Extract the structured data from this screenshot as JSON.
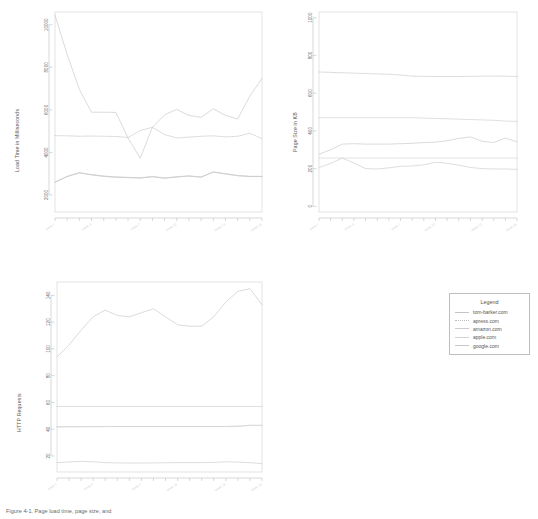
{
  "figure": {
    "caption": "Figure 4-1. Page load time, page size, and",
    "background": "#ffffff"
  },
  "legend": {
    "title": "Legend",
    "entries": [
      {
        "label": "tom-barker.com",
        "style": "solid",
        "color": "#c4c4c4"
      },
      {
        "label": "apress.com",
        "style": "dotted",
        "color": "#bcbcbc"
      },
      {
        "label": "amazon.com",
        "style": "solid",
        "color": "#cccccc"
      },
      {
        "label": "apple.com",
        "style": "solid",
        "color": "#d2d2d2"
      },
      {
        "label": "google.com",
        "style": "solid",
        "color": "#c8c8c8"
      }
    ]
  },
  "chart_data": [
    {
      "type": "line",
      "title": "",
      "xlabel": "",
      "ylabel": "Load Time in Milliseconds",
      "ylim": [
        1200,
        10600
      ],
      "yticks": [
        2000,
        4000,
        6000,
        8000,
        10000
      ],
      "grid": false,
      "legend_position": "external-right",
      "x": [
        1,
        2,
        3,
        4,
        5,
        6,
        7,
        8,
        9,
        10,
        11,
        12,
        13,
        14,
        15,
        16,
        17,
        18
      ],
      "xtick_labels": [
        "week 1",
        "week 4",
        "week 7",
        "week 10",
        "week 13",
        "week 16"
      ],
      "series": [
        {
          "name": "tom-barker.com",
          "style": "solid",
          "values": [
            10450,
            8600,
            6960,
            5890,
            5890,
            5880,
            4680,
            3730,
            5180,
            5770,
            6020,
            5740,
            5650,
            6050,
            5740,
            5570,
            6650,
            7480
          ]
        },
        {
          "name": "apress.com",
          "style": "dotted",
          "values": [
            4790,
            4780,
            4760,
            4770,
            4760,
            4750,
            4700,
            5030,
            5180,
            4840,
            4680,
            4720,
            4760,
            4780,
            4730,
            4760,
            4900,
            4650
          ]
        },
        {
          "name": "amazon.com",
          "style": "solid",
          "values": [
            2610,
            2880,
            3050,
            2960,
            2890,
            2850,
            2830,
            2810,
            2870,
            2800,
            2860,
            2900,
            2850,
            3090,
            3000,
            2920,
            2880,
            2880
          ]
        },
        {
          "name": "apple.com",
          "style": "solid",
          "values": [
            2600,
            2870,
            3040,
            2950,
            2880,
            2840,
            2820,
            2800,
            2860,
            2790,
            2850,
            2890,
            2840,
            3080,
            2990,
            2910,
            2870,
            2870
          ]
        },
        {
          "name": "google.com",
          "style": "solid",
          "values": [
            2595,
            2865,
            3035,
            2945,
            2875,
            2835,
            2815,
            2795,
            2855,
            2785,
            2845,
            2885,
            2835,
            3075,
            2985,
            2905,
            2865,
            2865
          ]
        }
      ]
    },
    {
      "type": "line",
      "title": "",
      "xlabel": "",
      "ylabel": "Page Size in KB",
      "ylim": [
        -30,
        1030
      ],
      "yticks": [
        0,
        200,
        400,
        600,
        800,
        1000
      ],
      "grid": false,
      "legend_position": "external-right",
      "x": [
        1,
        2,
        3,
        4,
        5,
        6,
        7,
        8,
        9,
        10,
        11,
        12,
        13,
        14,
        15,
        16,
        17,
        18
      ],
      "xtick_labels": [
        "week 1",
        "week 4",
        "week 7",
        "week 10",
        "week 13",
        "week 16"
      ],
      "series": [
        {
          "name": "tom-barker.com",
          "style": "solid",
          "values": [
            276,
            300,
            330,
            332,
            330,
            330,
            330,
            332,
            334,
            338,
            340,
            348,
            360,
            368,
            345,
            338,
            362,
            342
          ]
        },
        {
          "name": "apress.com",
          "style": "dotted",
          "values": [
            712,
            710,
            708,
            706,
            704,
            702,
            700,
            696,
            690,
            689,
            688,
            688,
            688,
            689,
            690,
            690,
            690,
            688
          ]
        },
        {
          "name": "amazon.com",
          "style": "solid",
          "values": [
            470,
            470,
            470,
            470,
            470,
            470,
            470,
            470,
            470,
            468,
            466,
            464,
            462,
            460,
            458,
            456,
            452,
            450
          ]
        },
        {
          "name": "apple.com",
          "style": "solid",
          "values": [
            256,
            256,
            256,
            256,
            256,
            256,
            256,
            256,
            256,
            256,
            256,
            256,
            256,
            256,
            256,
            256,
            256,
            256
          ]
        },
        {
          "name": "google.com",
          "style": "solid",
          "values": [
            205,
            228,
            256,
            230,
            200,
            198,
            204,
            212,
            214,
            220,
            234,
            228,
            218,
            206,
            200,
            198,
            198,
            196
          ]
        }
      ]
    },
    {
      "type": "line",
      "title": "",
      "xlabel": "",
      "ylabel": "HTTP Requests",
      "ylim": [
        8,
        150
      ],
      "yticks": [
        20,
        40,
        60,
        80,
        100,
        120,
        140
      ],
      "grid": false,
      "legend_position": "external-right",
      "x": [
        1,
        2,
        3,
        4,
        5,
        6,
        7,
        8,
        9,
        10,
        11,
        12,
        13,
        14,
        15,
        16,
        17,
        18
      ],
      "xtick_labels": [
        "week 1",
        "week 4",
        "week 7",
        "week 10",
        "week 13",
        "week 16"
      ],
      "series": [
        {
          "name": "tom-barker.com",
          "style": "solid",
          "values": [
            94,
            103,
            114,
            124,
            129,
            125,
            124,
            127,
            130,
            124,
            118,
            117,
            117,
            124,
            135,
            143,
            145,
            133
          ]
        },
        {
          "name": "apress.com",
          "style": "dotted",
          "values": [
            57,
            57,
            57,
            57,
            57,
            57,
            57,
            57,
            57,
            57,
            57,
            57,
            57,
            57,
            57,
            57,
            57,
            57
          ]
        },
        {
          "name": "amazon.com",
          "style": "solid",
          "values": [
            42,
            42,
            42,
            42,
            42,
            42,
            42,
            42,
            42,
            42,
            42,
            42,
            42,
            42,
            42,
            42,
            43,
            43
          ]
        },
        {
          "name": "apple.com",
          "style": "solid",
          "values": [
            41.5,
            41.6,
            41.7,
            41.8,
            41.9,
            42,
            42,
            42,
            42,
            42,
            42,
            42,
            42,
            42,
            42,
            42.5,
            42.8,
            42.8
          ]
        },
        {
          "name": "google.com",
          "style": "solid",
          "values": [
            15,
            15.5,
            16,
            15.6,
            15,
            14.8,
            14.7,
            14.7,
            14.8,
            14.9,
            15,
            15,
            15,
            15.2,
            15.6,
            15.4,
            15,
            14.2
          ]
        }
      ]
    }
  ]
}
